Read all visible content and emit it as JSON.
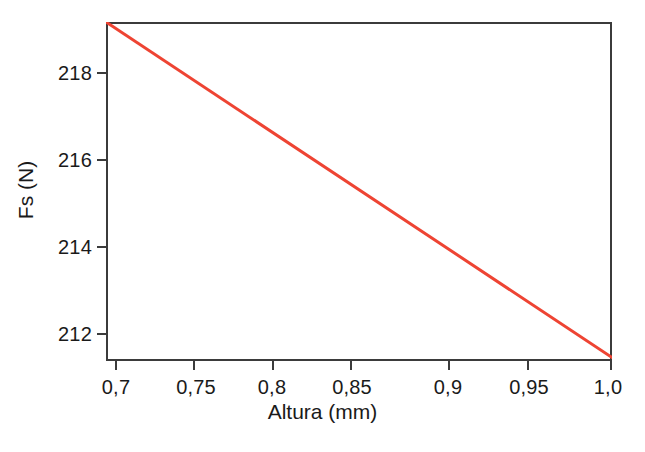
{
  "chart_data": {
    "type": "line",
    "title": "",
    "subtitle": "",
    "xlabel": "Altura (mm)",
    "ylabel": "Fs (N)",
    "xlim": [
      0.6937,
      1.0
    ],
    "ylim": [
      211.42,
      219.05
    ],
    "grid": false,
    "legend": null,
    "decimal_separator": ",",
    "x_ticks": [
      {
        "value": 0.7,
        "label": "0,7"
      },
      {
        "value": 0.75,
        "label": "0,75"
      },
      {
        "value": 0.8,
        "label": "0,8"
      },
      {
        "value": 0.85,
        "label": "0,85"
      },
      {
        "value": 0.9,
        "label": "0,9"
      },
      {
        "value": 0.95,
        "label": "0,95"
      },
      {
        "value": 1.0,
        "label": "1,0"
      }
    ],
    "y_ticks": [
      {
        "value": 218,
        "label": "218"
      },
      {
        "value": 216,
        "label": "216"
      },
      {
        "value": 214,
        "label": "214"
      },
      {
        "value": 212,
        "label": "212"
      }
    ],
    "series": [
      {
        "name": "Fs vs Altura",
        "color": "#ee4433",
        "line_width": 3,
        "marker": "none",
        "x": [
          0.6937,
          1.0
        ],
        "y": [
          219.05,
          211.5
        ]
      }
    ],
    "annotations": []
  },
  "colors": {
    "line": "#ee4433",
    "axis": "#3b3b3b",
    "text": "#1a1a1a",
    "background": "#ffffff"
  }
}
